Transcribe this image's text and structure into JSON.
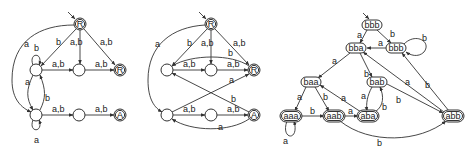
{
  "diagrams": [
    {
      "id": "automaton-1",
      "nodes": [
        {
          "id": "s",
          "label": "R",
          "x": 80,
          "y": 24,
          "accepting": true,
          "start": true
        },
        {
          "id": "lt",
          "label": "",
          "x": 36,
          "y": 70
        },
        {
          "id": "mt",
          "label": "",
          "x": 79,
          "y": 70
        },
        {
          "id": "rt",
          "label": "R",
          "x": 120,
          "y": 70,
          "accepting": true
        },
        {
          "id": "lb",
          "label": "",
          "x": 36,
          "y": 115
        },
        {
          "id": "mb",
          "label": "",
          "x": 79,
          "y": 115
        },
        {
          "id": "rb",
          "label": "A",
          "x": 120,
          "y": 115,
          "accepting": true
        }
      ],
      "edge_labels": {
        "s_lb": "a",
        "s_lt": "b",
        "s_mt": "a,b",
        "s_rt": "a,b",
        "lt_loop": "b",
        "lt_mt": "a,b",
        "mt_rt": "a,b",
        "lt_lb": "a",
        "lb_lt": "b",
        "lb_mb": "a,b",
        "mb_rb": "a,b",
        "lb_loop": "a"
      }
    },
    {
      "id": "automaton-2",
      "nodes": [
        {
          "id": "s",
          "label": "R",
          "x": 211,
          "y": 24,
          "accepting": true,
          "start": true
        },
        {
          "id": "lt",
          "label": "",
          "x": 167,
          "y": 70
        },
        {
          "id": "mt",
          "label": "",
          "x": 211,
          "y": 70
        },
        {
          "id": "rt",
          "label": "R",
          "x": 254,
          "y": 70,
          "accepting": true
        },
        {
          "id": "lb",
          "label": "",
          "x": 167,
          "y": 115
        },
        {
          "id": "mb",
          "label": "",
          "x": 211,
          "y": 115
        },
        {
          "id": "rb",
          "label": "A",
          "x": 254,
          "y": 115,
          "accepting": true
        }
      ],
      "edge_labels": {
        "s_lb": "a",
        "s_lt": "b",
        "s_mt": "a,b",
        "s_rt": "a,b",
        "rt_lt": "b",
        "lt_mt": "a,b",
        "mt_rt": "a,b",
        "lb_rt": "a",
        "rb_lt": "b",
        "lb_mb": "a,b",
        "mb_rb": "a,b",
        "rb_lb": "a"
      }
    },
    {
      "id": "automaton-3",
      "nodes": [
        {
          "id": "bbb0",
          "label": "bbb",
          "x": 372,
          "y": 25,
          "start": true
        },
        {
          "id": "bba",
          "label": "bba",
          "x": 356,
          "y": 48
        },
        {
          "id": "bbb1",
          "label": "bbb",
          "x": 396,
          "y": 48
        },
        {
          "id": "baa",
          "label": "baa",
          "x": 311,
          "y": 82
        },
        {
          "id": "bab",
          "label": "bab",
          "x": 377,
          "y": 82
        },
        {
          "id": "aaa",
          "label": "aaa",
          "x": 291,
          "y": 116,
          "accepting": true
        },
        {
          "id": "aab",
          "label": "aab",
          "x": 334,
          "y": 116,
          "accepting": true
        },
        {
          "id": "aba",
          "label": "aba",
          "x": 368,
          "y": 116,
          "accepting": true
        },
        {
          "id": "abb",
          "label": "abb",
          "x": 453,
          "y": 116,
          "accepting": true
        }
      ],
      "edge_labels": {
        "bbb0_bba": "a",
        "bbb0_bbb1": "b",
        "bbb1_bba": "a",
        "bbb1_loop": "b",
        "bba_baa": "a",
        "bba_bab": "b",
        "abb_bba": "a",
        "abb_bbb1": "b",
        "baa_aaa": "a",
        "baa_aab": "b",
        "aba_baa": "a",
        "bab_aba": "a",
        "aba_bab": "b",
        "bab_abb": "b",
        "aaa_aab": "b",
        "aab_aba": "a",
        "aaa_loop": "a",
        "aab_abb": "b"
      }
    }
  ]
}
